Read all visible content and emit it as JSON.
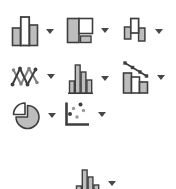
{
  "surface": {
    "kind": "ribbon-charts-group-fragment",
    "background": "#ffffff"
  },
  "colors": {
    "icon_outline": "#3e3e3e",
    "icon_fill_gray": "#bdbdbd",
    "icon_fill_white": "#ffffff",
    "secondary_line_gray": "#7e7e7e",
    "scatter_dot_gray": "#9a9a9a",
    "dropdown_caret": "#474747"
  },
  "buttons": [
    {
      "id": "insert-column-or-bar-chart",
      "icon": "column-chart-icon",
      "has_dropdown": true,
      "row": 1,
      "col": 1
    },
    {
      "id": "insert-hierarchy-chart",
      "icon": "treemap-icon",
      "has_dropdown": true,
      "row": 1,
      "col": 2
    },
    {
      "id": "insert-waterfall-chart",
      "icon": "waterfall-chart-icon",
      "has_dropdown": true,
      "row": 1,
      "col": 3
    },
    {
      "id": "insert-line-or-area-chart",
      "icon": "line-chart-icon",
      "has_dropdown": true,
      "row": 2,
      "col": 1
    },
    {
      "id": "insert-statistic-chart",
      "icon": "histogram-icon",
      "has_dropdown": true,
      "row": 2,
      "col": 2
    },
    {
      "id": "insert-combo-chart",
      "icon": "combo-chart-icon",
      "has_dropdown": true,
      "row": 2,
      "col": 3
    },
    {
      "id": "insert-pie-or-doughnut-chart",
      "icon": "pie-chart-icon",
      "has_dropdown": true,
      "row": 3,
      "col": 1
    },
    {
      "id": "insert-scatter-or-bubble-chart",
      "icon": "scatter-chart-icon",
      "has_dropdown": true,
      "row": 3,
      "col": 2
    },
    {
      "id": "insert-statistic-chart-secondary",
      "icon": "histogram-icon",
      "has_dropdown": true,
      "row": 4,
      "col": 1,
      "clipped_at_bottom": true
    }
  ]
}
